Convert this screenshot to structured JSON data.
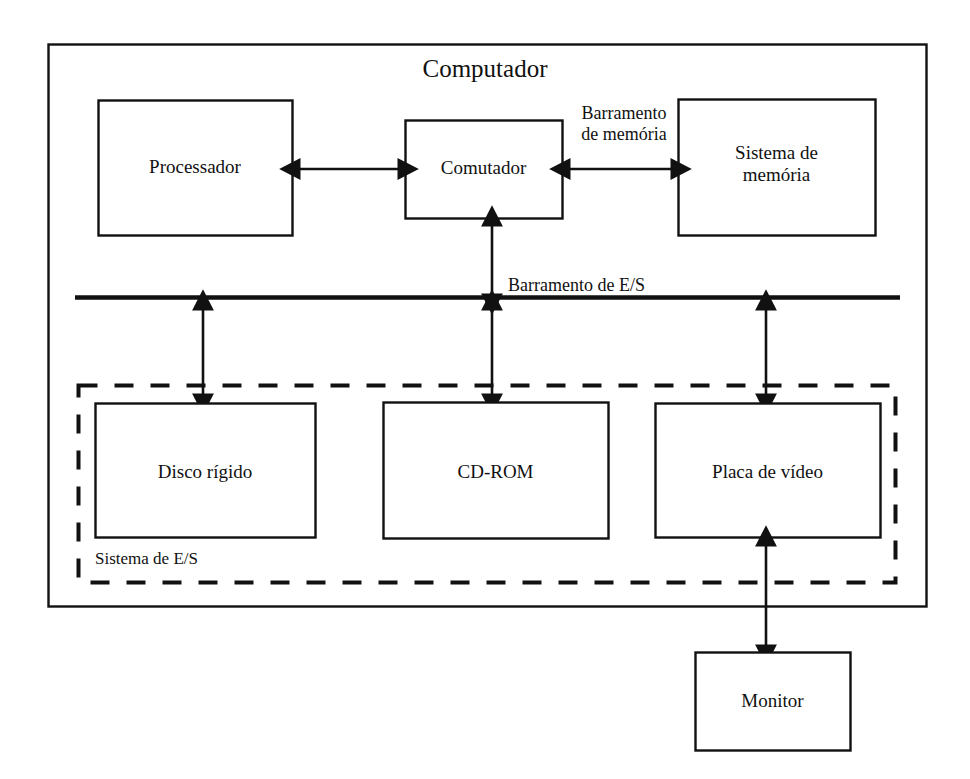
{
  "diagram": {
    "title": "Computador",
    "type": "block-diagram",
    "language": "pt-BR",
    "colors": {
      "background": "#ffffff",
      "stroke": "#111111",
      "text": "#111111"
    },
    "blocks": {
      "processor": {
        "label": "Processador"
      },
      "switch": {
        "label": "Comutador"
      },
      "memory_system": {
        "label": "Sistema de\nmemória",
        "line1": "Sistema de",
        "line2": "memória"
      },
      "hard_disk": {
        "label": "Disco rígido"
      },
      "cdrom": {
        "label": "CD-ROM"
      },
      "video_card": {
        "label": "Placa de vídeo"
      },
      "monitor": {
        "label": "Monitor"
      }
    },
    "buses": {
      "memory_bus": {
        "label": "Barramento\nde memória",
        "line1": "Barramento",
        "line2": "de memória"
      },
      "io_bus": {
        "label": "Barramento de E/S"
      }
    },
    "groups": {
      "io_system": {
        "label": "Sistema de E/S",
        "border_style": "dashed"
      }
    },
    "connections": [
      {
        "from": "processor",
        "to": "switch",
        "arrow": "bidirectional"
      },
      {
        "from": "switch",
        "to": "memory_system",
        "arrow": "bidirectional",
        "label": "Barramento de memória"
      },
      {
        "from": "switch",
        "to": "io_bus",
        "arrow": "bidirectional",
        "label": "Barramento de E/S"
      },
      {
        "from": "io_bus",
        "to": "hard_disk",
        "arrow": "bidirectional"
      },
      {
        "from": "io_bus",
        "to": "cdrom",
        "arrow": "bidirectional"
      },
      {
        "from": "io_bus",
        "to": "video_card",
        "arrow": "bidirectional"
      },
      {
        "from": "video_card",
        "to": "monitor",
        "arrow": "bidirectional"
      }
    ]
  }
}
